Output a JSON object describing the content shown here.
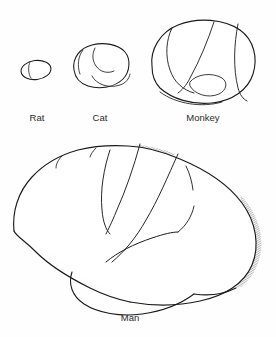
{
  "figure": {
    "background_color": "#fefefe",
    "ink_color": "#1a1a1a",
    "label_color": "#2b2b2b",
    "style": "pen-and-ink line drawing with stipple and hatch shading"
  },
  "specimens": [
    {
      "id": "rat",
      "label": "Rat",
      "label_x": 37,
      "label_y": 121,
      "label_size": 9.5,
      "center_x": 36,
      "center_y": 70,
      "width": 30,
      "height": 19,
      "regions": [
        "hatched-posterior-cortex"
      ]
    },
    {
      "id": "cat",
      "label": "Cat",
      "label_x": 100,
      "label_y": 121,
      "label_size": 9.5,
      "center_x": 100,
      "center_y": 68,
      "width": 56,
      "height": 42,
      "regions": [
        "stippled-frontal-patch",
        "white-wedge",
        "hatched-posterior-cortex",
        "hatched-temporal-lobe"
      ]
    },
    {
      "id": "monkey",
      "label": "Monkey",
      "label_x": 203,
      "label_y": 121,
      "label_size": 9.5,
      "center_x": 203,
      "center_y": 64,
      "width": 104,
      "height": 84,
      "regions": [
        "stippled-wedge",
        "hatched-wedge",
        "hatched-occipital-band",
        "hatched-temporal-lobe"
      ]
    },
    {
      "id": "man",
      "label": "Man",
      "label_x": 130,
      "label_y": 321,
      "label_size": 9.5,
      "center_x": 133,
      "center_y": 228,
      "width": 248,
      "height": 170,
      "regions": [
        "stippled-wedge",
        "hatched-wedge",
        "hatched-sylvian-band",
        "hatched-occipital-edge"
      ]
    }
  ],
  "textures": {
    "stipple_name": "stipple-dots",
    "hatch_name": "diagonal-hatch",
    "fine_hatch_name": "fine-diagonal-hatch"
  }
}
